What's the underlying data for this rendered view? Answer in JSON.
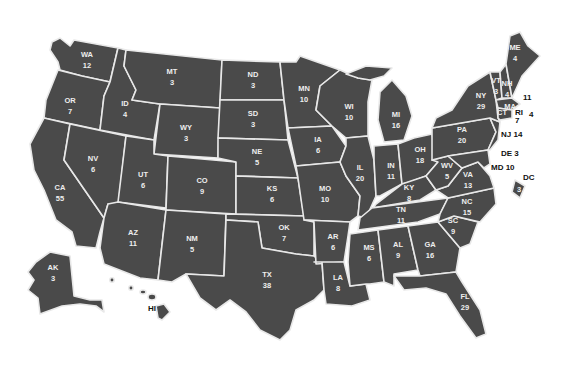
{
  "map": {
    "title": "",
    "fill_color": "#4a4a4a",
    "border_color": "#e8e8e8",
    "label_color": "#eeeeee",
    "states": [
      {
        "abbr": "WA",
        "votes": "12",
        "x": 87,
        "y": 60
      },
      {
        "abbr": "OR",
        "votes": "7",
        "x": 70,
        "y": 106
      },
      {
        "abbr": "CA",
        "votes": "55",
        "x": 60,
        "y": 193
      },
      {
        "abbr": "NV",
        "votes": "6",
        "x": 93,
        "y": 164
      },
      {
        "abbr": "ID",
        "votes": "4",
        "x": 125,
        "y": 109
      },
      {
        "abbr": "MT",
        "votes": "3",
        "x": 172,
        "y": 77
      },
      {
        "abbr": "WY",
        "votes": "3",
        "x": 186,
        "y": 133
      },
      {
        "abbr": "UT",
        "votes": "6",
        "x": 143,
        "y": 180
      },
      {
        "abbr": "CO",
        "votes": "9",
        "x": 202,
        "y": 186
      },
      {
        "abbr": "AZ",
        "votes": "11",
        "x": 133,
        "y": 238
      },
      {
        "abbr": "NM",
        "votes": "5",
        "x": 192,
        "y": 244
      },
      {
        "abbr": "ND",
        "votes": "3",
        "x": 253,
        "y": 80
      },
      {
        "abbr": "SD",
        "votes": "3",
        "x": 253,
        "y": 119
      },
      {
        "abbr": "NE",
        "votes": "5",
        "x": 257,
        "y": 157
      },
      {
        "abbr": "KS",
        "votes": "6",
        "x": 272,
        "y": 194
      },
      {
        "abbr": "OK",
        "votes": "7",
        "x": 284,
        "y": 233
      },
      {
        "abbr": "TX",
        "votes": "38",
        "x": 267,
        "y": 280
      },
      {
        "abbr": "MN",
        "votes": "10",
        "x": 304,
        "y": 94
      },
      {
        "abbr": "IA",
        "votes": "6",
        "x": 318,
        "y": 145
      },
      {
        "abbr": "MO",
        "votes": "10",
        "x": 325,
        "y": 194
      },
      {
        "abbr": "AR",
        "votes": "6",
        "x": 333,
        "y": 242
      },
      {
        "abbr": "LA",
        "votes": "8",
        "x": 338,
        "y": 283
      },
      {
        "abbr": "WI",
        "votes": "10",
        "x": 349,
        "y": 112
      },
      {
        "abbr": "IL",
        "votes": "20",
        "x": 360,
        "y": 173
      },
      {
        "abbr": "MI",
        "votes": "16",
        "x": 396,
        "y": 120
      },
      {
        "abbr": "IN",
        "votes": "11",
        "x": 391,
        "y": 171
      },
      {
        "abbr": "OH",
        "votes": "18",
        "x": 420,
        "y": 155
      },
      {
        "abbr": "KY",
        "votes": "8",
        "x": 409,
        "y": 193
      },
      {
        "abbr": "TN",
        "votes": "11",
        "x": 401,
        "y": 215
      },
      {
        "abbr": "MS",
        "votes": "6",
        "x": 369,
        "y": 253
      },
      {
        "abbr": "AL",
        "votes": "9",
        "x": 398,
        "y": 250
      },
      {
        "abbr": "GA",
        "votes": "16",
        "x": 430,
        "y": 250
      },
      {
        "abbr": "FL",
        "votes": "29",
        "x": 465,
        "y": 302
      },
      {
        "abbr": "SC",
        "votes": "9",
        "x": 453,
        "y": 226
      },
      {
        "abbr": "NC",
        "votes": "15",
        "x": 467,
        "y": 207
      },
      {
        "abbr": "VA",
        "votes": "13",
        "x": 468,
        "y": 180
      },
      {
        "abbr": "WV",
        "votes": "5",
        "x": 447,
        "y": 171
      },
      {
        "abbr": "PA",
        "votes": "20",
        "x": 462,
        "y": 135
      },
      {
        "abbr": "NY",
        "votes": "29",
        "x": 481,
        "y": 101
      },
      {
        "abbr": "VT",
        "votes": "3",
        "x": 496,
        "y": 86
      },
      {
        "abbr": "NH",
        "votes": "4",
        "x": 507,
        "y": 89
      },
      {
        "abbr": "ME",
        "votes": "4",
        "x": 515,
        "y": 53
      },
      {
        "abbr": "MA",
        "votes": "",
        "x": 510,
        "y": 106
      },
      {
        "abbr": "CT",
        "votes": "",
        "x": 502,
        "y": 112
      },
      {
        "abbr": "AK",
        "votes": "3",
        "x": 53,
        "y": 273
      }
    ],
    "external_labels": [
      {
        "text": "11",
        "x": 523,
        "y": 97,
        "for": "MA"
      },
      {
        "text": "RI",
        "x": 515,
        "y": 112,
        "for": "RI"
      },
      {
        "text": "4",
        "x": 529,
        "y": 114,
        "for": "RI"
      },
      {
        "text": "7",
        "x": 515,
        "y": 120,
        "for": "CT"
      },
      {
        "text": "NJ 14",
        "x": 501,
        "y": 134,
        "for": "NJ"
      },
      {
        "text": "DE  3",
        "x": 501,
        "y": 153,
        "for": "DE"
      },
      {
        "text": "MD 10",
        "x": 491,
        "y": 167,
        "for": "MD"
      },
      {
        "text": "DC",
        "x": 523,
        "y": 177,
        "for": "DC"
      },
      {
        "text": "HI",
        "x": 148,
        "y": 308,
        "for": "HI"
      }
    ],
    "dc_votes": "3"
  }
}
